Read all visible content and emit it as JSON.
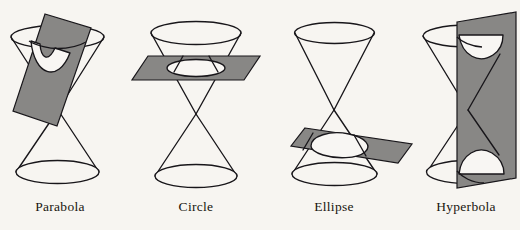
{
  "figure": {
    "background_color": "#f7f5f1",
    "ink_color": "#18161a",
    "plane_fill_color": "#888785",
    "panel_count": 4
  },
  "panels": [
    {
      "id": "parabola",
      "label": "Parabola",
      "label_x": 60,
      "label_y": 211,
      "plane_orientation": "oblique-steep",
      "cut_shape": "parabola",
      "description": "A plane tilted parallel to one side of the cone slices a single nappe, producing an open parabolic curve."
    },
    {
      "id": "circle",
      "label": "Circle",
      "label_x": 196,
      "label_y": 211,
      "plane_orientation": "horizontal",
      "cut_shape": "circle",
      "description": "A plane perpendicular to the cone axis slices the upper nappe, producing a circle."
    },
    {
      "id": "ellipse",
      "label": "Ellipse",
      "label_x": 334,
      "label_y": 211,
      "plane_orientation": "oblique-shallow",
      "cut_shape": "ellipse",
      "description": "A plane tilted at a shallow angle cuts completely through one nappe, producing an ellipse."
    },
    {
      "id": "hyperbola",
      "label": "Hyperbola",
      "label_x": 466,
      "label_y": 211,
      "plane_orientation": "vertical",
      "cut_shape": "hyperbola",
      "description": "A vertical plane parallel to the cone axis cuts both nappes, producing two hyperbolic branches."
    }
  ]
}
